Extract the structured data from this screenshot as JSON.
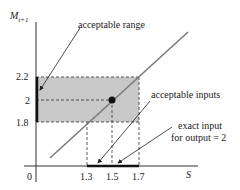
{
  "diagram": {
    "y_axis_label": "M",
    "y_axis_subscript": "t+1",
    "x_axis_label": "S",
    "origin_label": "0",
    "y_ticks": [
      "2.2",
      "2",
      "1.8"
    ],
    "x_ticks": [
      "1.3",
      "1.5",
      "1.7"
    ],
    "annotations": {
      "acceptable_range": "acceptable range",
      "acceptable_inputs": "acceptable inputs",
      "exact_input_line1": "exact input",
      "exact_input_line2": "for output = 2"
    },
    "colors": {
      "shaded_region": "#c8c8c8",
      "diagonal_line": "#777777",
      "axes": "#333333",
      "highlight": "#111111"
    }
  }
}
